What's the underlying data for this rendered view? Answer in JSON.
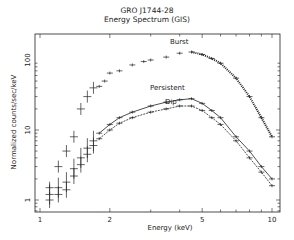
{
  "chart_data": {
    "type": "scatter",
    "title": "GRO J1744-28",
    "subtitle": "Energy Spectrum (GIS)",
    "xlabel": "Energy (keV)",
    "ylabel": "Normalized counts/sec/keV",
    "xscale": "log",
    "yscale": "log",
    "xlim": [
      1,
      10.3
    ],
    "ylim": [
      0.67,
      235
    ],
    "xticks": [
      "1",
      "2",
      "5",
      "10"
    ],
    "yticks": [
      "1",
      "10",
      "100"
    ],
    "grid": false,
    "legend": "inline annotations",
    "annotations": [
      "Burst",
      "Persistent",
      "Dip"
    ],
    "series": [
      {
        "name": "Burst",
        "x": [
          1.1,
          1.2,
          1.3,
          1.4,
          1.5,
          1.6,
          1.7,
          1.8,
          1.9,
          2.0,
          2.2,
          2.5,
          2.8,
          3.0,
          3.5,
          4.0,
          4.5,
          5.0,
          5.5,
          6.0,
          7.0,
          8.0,
          9.0,
          10.0
        ],
        "y": [
          1.5,
          3,
          5,
          8,
          20,
          30,
          40,
          42,
          50,
          65,
          70,
          85,
          95,
          100,
          110,
          125,
          130,
          120,
          105,
          90,
          55,
          30,
          15,
          8
        ]
      },
      {
        "name": "Persistent",
        "x": [
          1.1,
          1.2,
          1.3,
          1.4,
          1.5,
          1.6,
          1.7,
          1.8,
          2.0,
          2.2,
          2.5,
          3.0,
          3.5,
          4.0,
          4.5,
          5.0,
          5.5,
          6.0,
          7.0,
          8.0,
          9.0,
          10.0
        ],
        "y": [
          1.2,
          1.5,
          1.8,
          2.8,
          4,
          5.5,
          7,
          9,
          12,
          15,
          18,
          22,
          25,
          27,
          28,
          24,
          19,
          15,
          8,
          5,
          3,
          2
        ]
      },
      {
        "name": "Dip",
        "x": [
          1.1,
          1.2,
          1.3,
          1.4,
          1.5,
          1.6,
          1.7,
          1.8,
          2.0,
          2.2,
          2.5,
          3.0,
          3.5,
          4.0,
          4.5,
          5.0,
          5.5,
          6.0,
          7.0,
          8.0,
          9.0,
          10.0
        ],
        "y": [
          1.0,
          1.2,
          1.4,
          2.2,
          3.2,
          4.5,
          6,
          7.5,
          10,
          12.5,
          15,
          18,
          20,
          22,
          22,
          19,
          15,
          12,
          7,
          4,
          2.5,
          1.6
        ]
      }
    ]
  }
}
